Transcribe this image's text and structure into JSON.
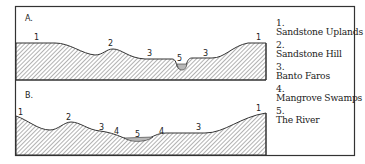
{
  "panels": [
    {
      "id": "A",
      "label": "A.",
      "zone_labels": [
        "1",
        "2",
        "3",
        "5",
        "3",
        "1"
      ]
    },
    {
      "id": "B",
      "label": "B.",
      "zone_labels": [
        "1",
        "2",
        "3",
        "4",
        "5",
        "4",
        "3",
        "1"
      ]
    }
  ],
  "legend": [
    {
      "number": "1.",
      "label": "Sandstone Uplands"
    },
    {
      "number": "2.",
      "label": "Sandstone Hill"
    },
    {
      "number": "3.",
      "label": "Banto Faros"
    },
    {
      "number": "4.",
      "label": "Mangrove Swamps"
    },
    {
      "number": "5.",
      "label": "The River"
    }
  ],
  "colors": {
    "line": "#333333",
    "hatch": "#555555",
    "water": "#b8b8b8",
    "background": "#ffffff"
  }
}
